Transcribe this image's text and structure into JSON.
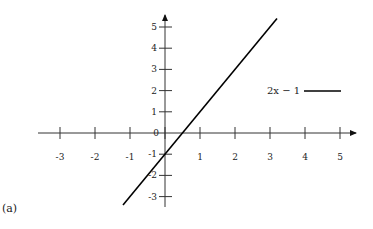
{
  "chart_data": {
    "type": "line",
    "title": "",
    "xlabel": "",
    "ylabel": "",
    "xlim": [
      -3.3,
      5.4
    ],
    "ylim": [
      -3.3,
      5.6
    ],
    "grid": false,
    "legend_position": "right, upper-middle",
    "x_ticks": [
      -3,
      -2,
      -1,
      0,
      1,
      2,
      3,
      4,
      5
    ],
    "x_tick_labels": [
      "-3",
      "-2",
      "-1",
      "0",
      "1",
      "2",
      "3",
      "4",
      "5"
    ],
    "y_ticks": [
      -3,
      -2,
      -1,
      1,
      2,
      3,
      4,
      5
    ],
    "y_tick_labels": [
      "-3",
      "-2",
      "-1",
      "1",
      "2",
      "3",
      "4",
      "5"
    ],
    "series": [
      {
        "name": "2x − 1",
        "function": "2x - 1",
        "x": [
          -1.2,
          3.2
        ],
        "y": [
          -3.4,
          5.4
        ],
        "color": "#000000"
      }
    ]
  },
  "legend": {
    "label": "2x − 1"
  },
  "panel_label": "(a)"
}
